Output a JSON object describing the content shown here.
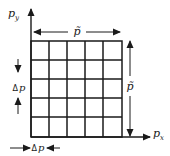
{
  "diagram": {
    "type": "momentum-space grid",
    "axes": {
      "x_label": "p",
      "x_subscript": "x",
      "y_label": "p",
      "y_subscript": "y"
    },
    "grid": {
      "rows": 5,
      "columns": 5
    },
    "dimensions": {
      "width_label": "p̃",
      "height_label": "p̃",
      "cell_width_label_delta": "Δ",
      "cell_width_label_var": "p",
      "cell_height_label_delta": "Δ",
      "cell_height_label_var": "p"
    },
    "colors": {
      "ink": "#1a1a1a",
      "background": "#ffffff"
    }
  }
}
